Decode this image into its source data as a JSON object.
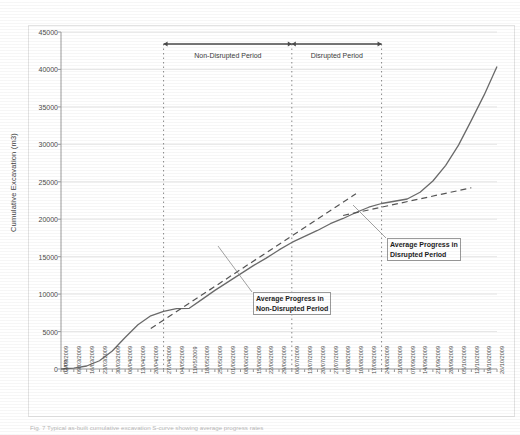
{
  "figure": {
    "caption": "Fig. 7 Typical as-built cumulative excavation S-curve showing average progress rates"
  },
  "chart_data": {
    "type": "line",
    "title": "",
    "xlabel": "Date",
    "ylabel": "Cumulative Excavation (m3)",
    "ylim": [
      0,
      45000
    ],
    "ytick_step": 5000,
    "grid": true,
    "legend_position": "none",
    "yticks": [
      "45000",
      "40000",
      "35000",
      "30000",
      "25000",
      "20000",
      "15000",
      "10000",
      "5000",
      "0"
    ],
    "categories": [
      "02/03/2009",
      "09/03/2009",
      "16/03/2009",
      "23/03/2009",
      "30/03/2009",
      "06/04/2009",
      "13/04/2009",
      "20/04/2009",
      "27/04/2009",
      "04/05/2009",
      "11/05/2009",
      "18/05/2009",
      "25/05/2009",
      "01/06/2009",
      "08/06/2009",
      "15/06/2009",
      "22/06/2009",
      "29/06/2009",
      "06/07/2009",
      "13/07/2009",
      "20/07/2009",
      "27/07/2009",
      "03/08/2009",
      "10/08/2009",
      "17/08/2009",
      "24/08/2009",
      "31/08/2009",
      "07/09/2009",
      "14/09/2009",
      "21/09/2009",
      "28/09/2009",
      "05/10/2009",
      "12/10/2009",
      "19/10/2009",
      "26/10/2009"
    ],
    "series": [
      {
        "name": "Cumulative Excavation",
        "style": "solid",
        "color": "#6b6b6b",
        "values": [
          0,
          120,
          400,
          1100,
          2400,
          4200,
          5900,
          7100,
          7700,
          8050,
          8100,
          9300,
          10500,
          11600,
          12700,
          13800,
          14800,
          15900,
          16900,
          17700,
          18500,
          19400,
          20100,
          20900,
          21600,
          22100,
          22400,
          22700,
          23600,
          25100,
          27200,
          29900,
          33200,
          36600,
          40400
        ]
      },
      {
        "name": "Average Progress in Non-Disrupted Period",
        "style": "dashed",
        "color": "#555555",
        "trend_from_index": 7,
        "trend_to_index": 23,
        "start_value": 5400,
        "end_value": 23400
      },
      {
        "name": "Average Progress in Disrupted Period",
        "style": "dashed",
        "color": "#555555",
        "trend_from_index": 22,
        "trend_to_index": 32,
        "start_value": 20500,
        "end_value": 24200
      }
    ],
    "period_spans": [
      {
        "label": "Non-Disrupted Period",
        "from_category": "27/04/2009",
        "to_category": "06/07/2009",
        "from_index": 8,
        "to_index": 18
      },
      {
        "label": "Disrupted Period",
        "from_category": "06/07/2009",
        "to_category": "24/08/2009",
        "from_index": 18,
        "to_index": 25
      }
    ],
    "dividers": [
      {
        "at_index": 8,
        "at_category": "27/04/2009"
      },
      {
        "at_index": 18,
        "at_category": "06/07/2009"
      },
      {
        "at_index": 25,
        "at_category": "24/08/2009"
      }
    ],
    "annotations": [
      {
        "name": "average-progress-non-disrupted",
        "line1": "Average Progress in",
        "line2": "Non-Disrupted Period"
      },
      {
        "name": "average-progress-disrupted",
        "line1": "Average Progress in",
        "line2": "Disrupted Period"
      }
    ]
  }
}
